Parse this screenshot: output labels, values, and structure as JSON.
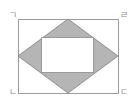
{
  "figure": {
    "type": "geometry-diagram",
    "colors": {
      "background": "#ffffff",
      "outline": "#9b9b9b",
      "rhombus_fill": "#b5b5b5",
      "rhombus_stroke": "#8f8f8f",
      "inner_rect_fill": "#ffffff",
      "inner_rect_stroke": "#9b9b9b",
      "label_color": "#8c8c8c"
    },
    "outer_rectangle": {
      "name": "outer-rectangle",
      "x": 18,
      "y": 19,
      "width": 100,
      "height": 74
    },
    "rhombus": {
      "name": "inscribed-rhombus",
      "points": "68,19 118,56 68,93 18,56",
      "vertices": [
        {
          "label": "top",
          "x": 68,
          "y": 19
        },
        {
          "label": "right",
          "x": 118,
          "y": 56
        },
        {
          "label": "bottom",
          "x": 68,
          "y": 93
        },
        {
          "label": "left",
          "x": 18,
          "y": 56
        }
      ]
    },
    "inner_rectangle": {
      "name": "inner-rectangle",
      "x": 41,
      "y": 37,
      "width": 52,
      "height": 35
    },
    "labels": {
      "top_left": "ㄱ",
      "top_right": "ㄹ",
      "bottom_left": "ㄴ",
      "bottom_right": "ㄷ"
    }
  }
}
